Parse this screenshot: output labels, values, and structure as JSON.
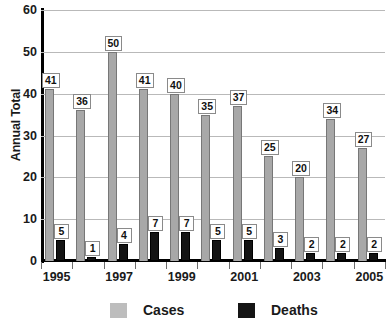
{
  "chart_data": {
    "type": "bar",
    "title": "",
    "xlabel": "",
    "ylabel": "Annual Total",
    "ylim": [
      0,
      60
    ],
    "yticks": [
      0,
      10,
      20,
      30,
      40,
      50,
      60
    ],
    "grid": true,
    "legend_position": "bottom",
    "categories": [
      "1995",
      "1996",
      "1997",
      "1998",
      "1999",
      "2000",
      "2001",
      "2002",
      "2003",
      "2004",
      "2005"
    ],
    "xtick_labels": [
      "1995",
      "1997",
      "1999",
      "2001",
      "2003",
      "2005"
    ],
    "series": [
      {
        "name": "Cases",
        "color": "#a8a8a8",
        "values": [
          41,
          36,
          50,
          41,
          40,
          35,
          37,
          25,
          20,
          34,
          27
        ]
      },
      {
        "name": "Deaths",
        "color": "#141414",
        "values": [
          5,
          1,
          4,
          7,
          7,
          5,
          5,
          3,
          2,
          2,
          2
        ]
      }
    ]
  },
  "axis": {
    "y_title": "Annual Total"
  },
  "legend": {
    "items": [
      {
        "label": "Cases",
        "swatch": "cases-swatch"
      },
      {
        "label": "Deaths",
        "swatch": "deaths-swatch"
      }
    ]
  }
}
